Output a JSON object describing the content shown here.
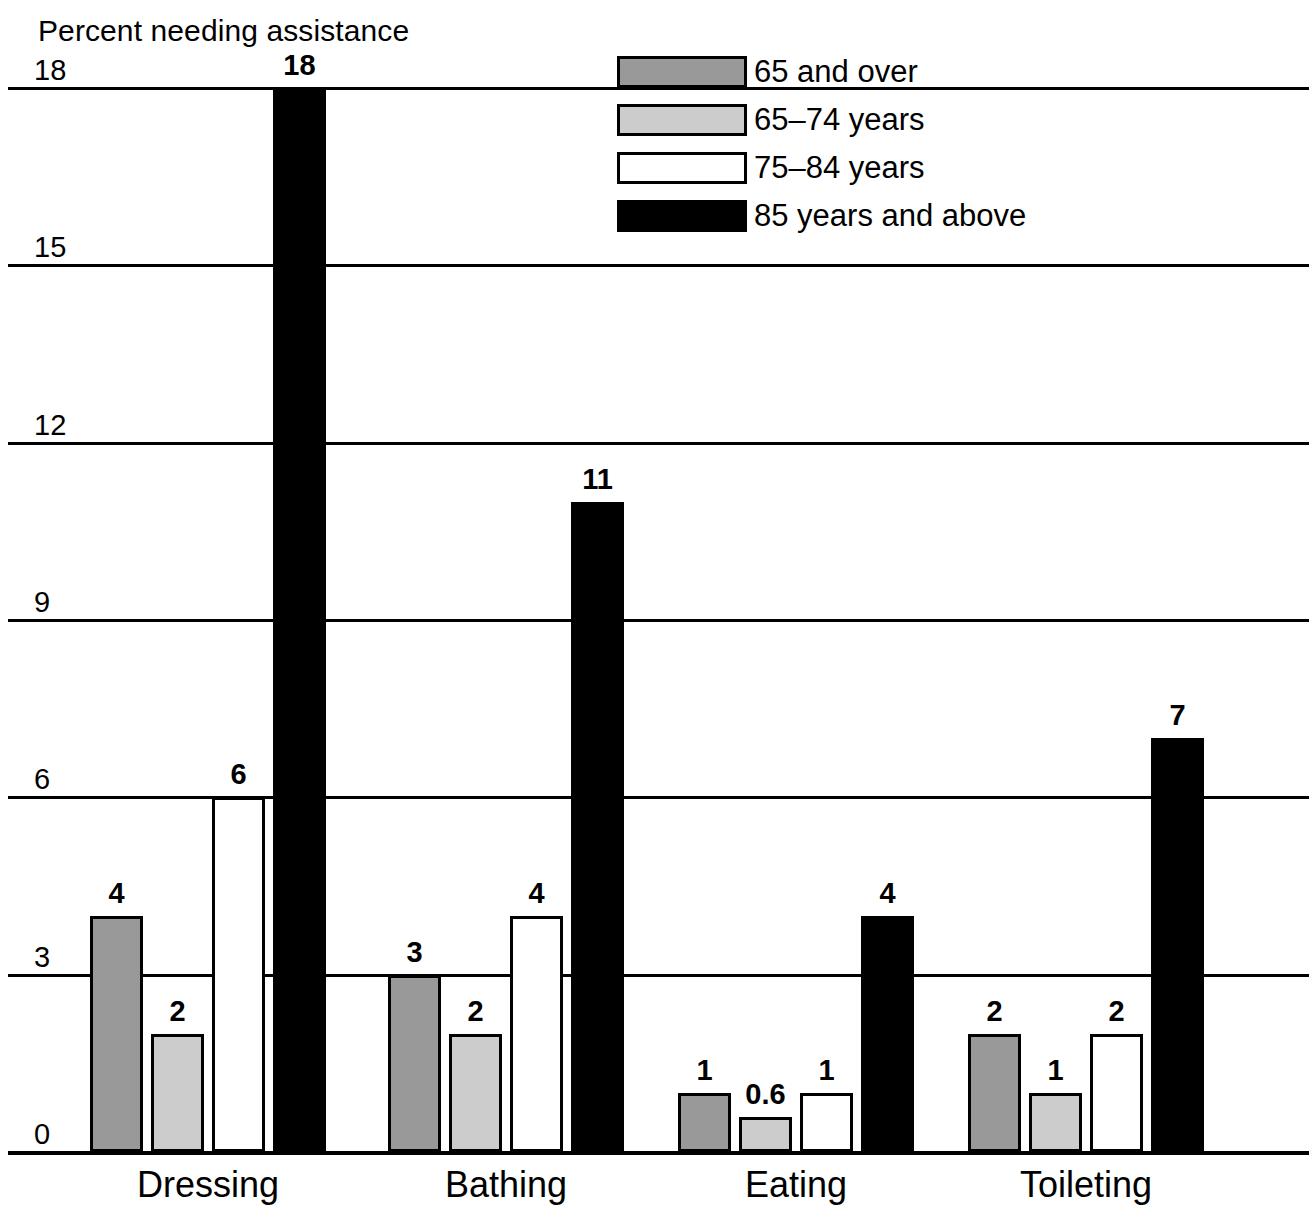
{
  "chart_data": {
    "type": "bar",
    "title": "Percent needing assistance",
    "xlabel": "",
    "ylabel": "Percent needing assistance",
    "ylim": [
      0,
      18
    ],
    "yticks": [
      "0",
      "3",
      "6",
      "9",
      "12",
      "15",
      "18"
    ],
    "grid": true,
    "legend_position": "top-right",
    "categories": [
      "Dressing",
      "Bathing",
      "Eating",
      "Toileting"
    ],
    "series": [
      {
        "name": "65 and over",
        "color": "#999999",
        "values": [
          4,
          3,
          1,
          2
        ],
        "labels": [
          "4",
          "3",
          "1",
          "2"
        ]
      },
      {
        "name": "65–74 years",
        "color": "#cccccc",
        "values": [
          2,
          2,
          0.6,
          1
        ],
        "labels": [
          "2",
          "2",
          "0.6",
          "1"
        ]
      },
      {
        "name": "75–84 years",
        "color": "#ffffff",
        "values": [
          6,
          4,
          1,
          2
        ],
        "labels": [
          "6",
          "4",
          "1",
          "2"
        ]
      },
      {
        "name": "85 years and above",
        "color": "#000000",
        "values": [
          18,
          11,
          4,
          7
        ],
        "labels": [
          "18",
          "11",
          "4",
          "7"
        ]
      }
    ]
  },
  "legend": {
    "items": [
      {
        "label": "65 and over",
        "swatch": "#999999"
      },
      {
        "label": "65–74 years",
        "swatch": "#cccccc"
      },
      {
        "label": "75–84 years",
        "swatch": "#ffffff"
      },
      {
        "label": "85 years and above",
        "swatch": "#000000"
      }
    ]
  },
  "axis": {
    "title": "Percent needing assistance",
    "yticks": [
      "18",
      "15",
      "12",
      "9",
      "6",
      "3",
      "0"
    ]
  }
}
